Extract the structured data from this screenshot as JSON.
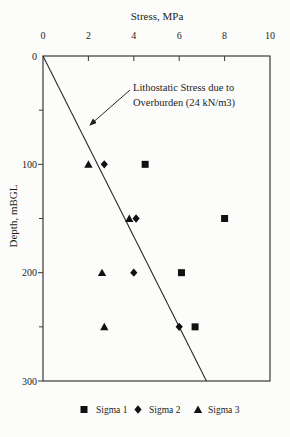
{
  "chart_data": {
    "type": "scatter",
    "title": "Stress, MPa",
    "xlabel": "Stress, MPa",
    "ylabel": "Depth, mBGL",
    "x_axis": {
      "min": 0,
      "max": 10,
      "ticks": [
        0,
        2,
        4,
        6,
        8,
        10
      ],
      "label_position": "top"
    },
    "y_axis": {
      "min": 0,
      "max": 300,
      "major_ticks": [
        0,
        100,
        200,
        300
      ],
      "minor_ticks": [
        50,
        150,
        250
      ],
      "inverted": true
    },
    "series": [
      {
        "name": "Sigma 1",
        "marker": "square",
        "points": [
          [
            4.5,
            100
          ],
          [
            8.0,
            150
          ],
          [
            6.1,
            200
          ],
          [
            6.7,
            250
          ]
        ]
      },
      {
        "name": "Sigma 2",
        "marker": "diamond",
        "points": [
          [
            2.7,
            100
          ],
          [
            4.1,
            150
          ],
          [
            4.0,
            200
          ],
          [
            6.0,
            250
          ]
        ]
      },
      {
        "name": "Sigma 3",
        "marker": "triangle",
        "points": [
          [
            2.0,
            100
          ],
          [
            3.8,
            150
          ],
          [
            2.6,
            200
          ],
          [
            2.7,
            250
          ]
        ]
      }
    ],
    "reference_line": {
      "label": "Lithostatic Stress due to Overburden (24 kN/m3)",
      "gradient_kn_per_m3": 24,
      "points": [
        [
          0,
          0
        ],
        [
          7.2,
          300
        ]
      ]
    },
    "annotation": {
      "line1": "Lithostatic Stress due to",
      "line2": "Overburden (24 kN/m3)"
    },
    "legend_position": "bottom",
    "grid": false
  },
  "colors": {
    "ink": "#1c1c1c",
    "axis": "#3a3a3a",
    "marker": "#111111",
    "background": "#fcfcfa"
  }
}
